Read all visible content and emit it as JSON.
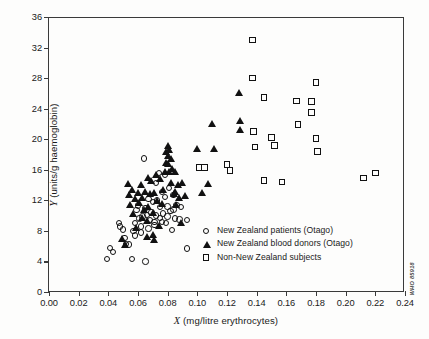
{
  "figure": {
    "credit": "WHO 85918"
  },
  "chart_data": {
    "type": "scatter",
    "title": "",
    "xlabel": "X (mg/litre erythrocytes)",
    "xlabel_italic": "X",
    "xlabel_rest": "(mg/litre erythrocytes)",
    "ylabel": "Y (units/g haemoglobin)",
    "ylabel_italic": "Y",
    "ylabel_rest": "(units/g haemoglobin)",
    "xlim": [
      0.0,
      0.24
    ],
    "ylim": [
      0,
      36
    ],
    "xticks": [
      0.0,
      0.02,
      0.04,
      0.06,
      0.08,
      0.1,
      0.12,
      0.14,
      0.16,
      0.18,
      0.2,
      0.22,
      0.24
    ],
    "xtick_labels": [
      "0.00",
      "0.02",
      "0.04",
      "0.06",
      "0.08",
      "0.10",
      "0.12",
      "0.14",
      "0.16",
      "0.18",
      "0.20",
      "0.22",
      "0.24"
    ],
    "yticks": [
      0,
      4,
      8,
      12,
      16,
      20,
      24,
      28,
      32,
      36
    ],
    "ytick_labels": [
      "0",
      "4",
      "8",
      "12",
      "16",
      "20",
      "24",
      "28",
      "32",
      "36"
    ],
    "grid": false,
    "legend_position": "lower-right-inside",
    "series": [
      {
        "name": "New Zealand patients (Otago)",
        "marker": "circle",
        "filled": false,
        "color": "#111111",
        "points": [
          [
            0.039,
            4.3
          ],
          [
            0.041,
            5.8
          ],
          [
            0.043,
            5.2
          ],
          [
            0.047,
            9.0
          ],
          [
            0.048,
            8.6
          ],
          [
            0.05,
            8.2
          ],
          [
            0.051,
            7.1
          ],
          [
            0.052,
            6.3
          ],
          [
            0.054,
            6.2
          ],
          [
            0.056,
            4.3
          ],
          [
            0.057,
            8.0
          ],
          [
            0.058,
            9.0
          ],
          [
            0.059,
            10.7
          ],
          [
            0.06,
            11.3
          ],
          [
            0.061,
            9.6
          ],
          [
            0.062,
            8.6
          ],
          [
            0.063,
            9.9
          ],
          [
            0.064,
            17.5
          ],
          [
            0.065,
            4.0
          ],
          [
            0.065,
            11.0
          ],
          [
            0.066,
            10.1
          ],
          [
            0.067,
            12.2
          ],
          [
            0.068,
            9.4
          ],
          [
            0.069,
            10.4
          ],
          [
            0.07,
            11.8
          ],
          [
            0.071,
            9.2
          ],
          [
            0.072,
            14.3
          ],
          [
            0.072,
            10.0
          ],
          [
            0.073,
            12.0
          ],
          [
            0.074,
            15.6
          ],
          [
            0.075,
            9.7
          ],
          [
            0.075,
            11.1
          ],
          [
            0.076,
            13.1
          ],
          [
            0.077,
            10.3
          ],
          [
            0.078,
            15.3
          ],
          [
            0.078,
            12.4
          ],
          [
            0.079,
            9.0
          ],
          [
            0.08,
            11.2
          ],
          [
            0.081,
            13.6
          ],
          [
            0.082,
            10.6
          ],
          [
            0.083,
            8.1
          ],
          [
            0.084,
            12.7
          ],
          [
            0.085,
            9.6
          ],
          [
            0.086,
            11.4
          ],
          [
            0.088,
            9.5
          ],
          [
            0.089,
            11.1
          ],
          [
            0.093,
            9.4
          ],
          [
            0.093,
            5.7
          ],
          [
            0.058,
            7.4
          ],
          [
            0.062,
            7.8
          ],
          [
            0.067,
            8.3
          ],
          [
            0.071,
            8.8
          ],
          [
            0.076,
            9.2
          ],
          [
            0.08,
            9.9
          ],
          [
            0.084,
            10.8
          ]
        ]
      },
      {
        "name": "New Zealand blood donors (Otago)",
        "marker": "triangle",
        "filled": true,
        "color": "#111111",
        "points": [
          [
            0.049,
            7.0
          ],
          [
            0.051,
            6.2
          ],
          [
            0.053,
            14.2
          ],
          [
            0.054,
            12.8
          ],
          [
            0.055,
            11.4
          ],
          [
            0.056,
            13.4
          ],
          [
            0.057,
            10.2
          ],
          [
            0.058,
            12.2
          ],
          [
            0.059,
            8.4
          ],
          [
            0.06,
            13.0
          ],
          [
            0.061,
            11.7
          ],
          [
            0.062,
            14.0
          ],
          [
            0.063,
            12.4
          ],
          [
            0.064,
            10.8
          ],
          [
            0.065,
            13.2
          ],
          [
            0.066,
            9.3
          ],
          [
            0.067,
            15.0
          ],
          [
            0.067,
            11.2
          ],
          [
            0.068,
            12.9
          ],
          [
            0.069,
            14.6
          ],
          [
            0.07,
            10.4
          ],
          [
            0.07,
            7.5
          ],
          [
            0.071,
            13.0
          ],
          [
            0.072,
            15.4
          ],
          [
            0.073,
            12.0
          ],
          [
            0.074,
            8.7
          ],
          [
            0.075,
            14.9
          ],
          [
            0.076,
            11.6
          ],
          [
            0.077,
            13.4
          ],
          [
            0.078,
            15.7
          ],
          [
            0.079,
            18.4
          ],
          [
            0.079,
            17.0
          ],
          [
            0.08,
            19.2
          ],
          [
            0.08,
            17.9
          ],
          [
            0.08,
            16.8
          ],
          [
            0.081,
            18.7
          ],
          [
            0.081,
            15.8
          ],
          [
            0.082,
            17.4
          ],
          [
            0.082,
            14.3
          ],
          [
            0.083,
            16.2
          ],
          [
            0.084,
            12.9
          ],
          [
            0.085,
            15.7
          ],
          [
            0.085,
            13.2
          ],
          [
            0.086,
            11.5
          ],
          [
            0.087,
            14.1
          ],
          [
            0.088,
            12.3
          ],
          [
            0.089,
            9.1
          ],
          [
            0.09,
            14.3
          ],
          [
            0.092,
            12.6
          ],
          [
            0.1,
            18.8
          ],
          [
            0.103,
            13.0
          ],
          [
            0.107,
            14.2
          ],
          [
            0.11,
            22.0
          ],
          [
            0.111,
            18.8
          ],
          [
            0.128,
            26.1
          ],
          [
            0.129,
            22.4
          ],
          [
            0.129,
            21.2
          ],
          [
            0.066,
            7.2
          ],
          [
            0.071,
            6.9
          ],
          [
            0.063,
            9.8
          ]
        ]
      },
      {
        "name": "Non-New Zealand subjects",
        "marker": "square",
        "filled": false,
        "color": "#111111",
        "points": [
          [
            0.101,
            16.3
          ],
          [
            0.105,
            16.3
          ],
          [
            0.12,
            16.7
          ],
          [
            0.122,
            15.9
          ],
          [
            0.137,
            33.0
          ],
          [
            0.137,
            28.0
          ],
          [
            0.138,
            21.0
          ],
          [
            0.139,
            19.0
          ],
          [
            0.145,
            25.5
          ],
          [
            0.145,
            14.6
          ],
          [
            0.15,
            20.2
          ],
          [
            0.152,
            19.2
          ],
          [
            0.157,
            14.4
          ],
          [
            0.167,
            25.0
          ],
          [
            0.168,
            21.9
          ],
          [
            0.177,
            24.9
          ],
          [
            0.177,
            23.5
          ],
          [
            0.18,
            27.4
          ],
          [
            0.18,
            20.1
          ],
          [
            0.181,
            18.4
          ],
          [
            0.212,
            14.9
          ],
          [
            0.22,
            15.6
          ]
        ]
      }
    ]
  },
  "legend": {
    "items": [
      {
        "label": "New Zealand patients (Otago)",
        "marker": "circle"
      },
      {
        "label": "New Zealand blood donors (Otago)",
        "marker": "triangle"
      },
      {
        "label": "Non-New Zealand subjects",
        "marker": "square"
      }
    ]
  }
}
